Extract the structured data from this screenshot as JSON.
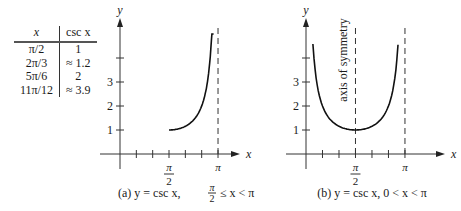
{
  "table": {
    "headers": [
      "x",
      "csc x"
    ],
    "rows": [
      [
        "π/2",
        "1"
      ],
      [
        "2π/3",
        "≈ 1.2"
      ],
      [
        "5π/6",
        "2"
      ],
      [
        "11π/12",
        "≈ 3.9"
      ]
    ]
  },
  "chart_data": [
    {
      "type": "line",
      "panel": "a",
      "title": "(a)  y = csc x, π/2 ≤ x < π",
      "caption_parts": {
        "label": "(a)",
        "eq": "y = csc x,",
        "frac_num": "π",
        "frac_den": "2",
        "ineq": "≤ x < π"
      },
      "xlabel": "x",
      "ylabel": "y",
      "function": "csc",
      "domain": [
        1.5708,
        3.0
      ],
      "xlim": [
        -0.55,
        3.4
      ],
      "ylim": [
        -0.6,
        4.7
      ],
      "x_ticks_count_per_pi": 6,
      "x_tick_labels": [
        {
          "value": 1.5708,
          "num": "π",
          "den": "2"
        },
        {
          "value": 3.14159,
          "text": "π"
        }
      ],
      "y_ticks": [
        1,
        2,
        3,
        4
      ],
      "y_tick_labels": [
        "1",
        "2",
        "3"
      ],
      "asymptotes": [
        3.14159
      ],
      "points": [
        [
          1.5708,
          1
        ],
        [
          2.0944,
          1.155
        ],
        [
          2.618,
          2
        ],
        [
          2.8798,
          3.864
        ]
      ]
    },
    {
      "type": "line",
      "panel": "b",
      "title": "(b)  y = csc x, 0 < x < π",
      "caption_parts": {
        "label": "(b)",
        "eq": "y = csc x, 0 < x < π"
      },
      "xlabel": "x",
      "ylabel": "y",
      "function": "csc",
      "domain": [
        0.22,
        2.92
      ],
      "xlim": [
        -0.55,
        3.4
      ],
      "ylim": [
        -0.6,
        4.7
      ],
      "x_tick_labels": [
        {
          "value": 1.5708,
          "num": "π",
          "den": "2"
        },
        {
          "value": 3.14159,
          "text": "π"
        }
      ],
      "y_ticks": [
        1,
        2,
        3,
        4
      ],
      "y_tick_labels": [
        "1",
        "2",
        "3"
      ],
      "asymptotes": [
        1.5708,
        3.14159
      ],
      "annotation": "axis of symmetry"
    }
  ]
}
